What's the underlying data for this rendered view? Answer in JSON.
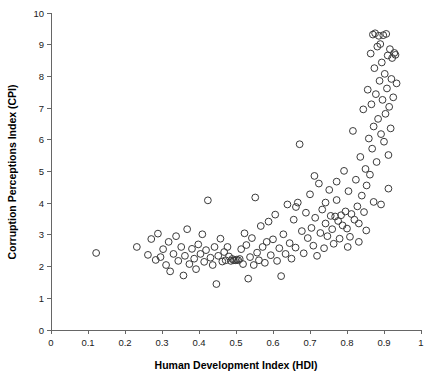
{
  "chart_data": {
    "type": "scatter",
    "title": "",
    "xlabel": "Human Development Index (HDI)",
    "ylabel": "Corruption Perceptions Index (CPI)",
    "xlim": [
      0,
      1
    ],
    "ylim": [
      0,
      10
    ],
    "xticks": [
      0,
      0.1,
      0.2,
      0.3,
      0.4,
      0.5,
      0.6,
      0.7,
      0.8,
      0.9,
      1
    ],
    "xtick_labels": [
      "0",
      "0.1",
      "0.2",
      "0.3",
      "0.4",
      "0.5",
      "0.6",
      "0.7",
      "0.8",
      "0.9",
      "1"
    ],
    "yticks": [
      0,
      1,
      2,
      3,
      4,
      5,
      6,
      7,
      8,
      9,
      10
    ],
    "ytick_labels": [
      "0",
      "1",
      "2",
      "3",
      "4",
      "5",
      "6",
      "7",
      "8",
      "9",
      "10"
    ],
    "grid": false,
    "legend": false,
    "marker": {
      "shape": "circle",
      "filled": false,
      "radius_px": 3.4,
      "stroke": "#3a3a3a",
      "stroke_width": 1
    },
    "axis_color": "#666666",
    "background": "#ffffff",
    "n_points": 160,
    "points": [
      [
        0.122,
        2.43
      ],
      [
        0.232,
        2.62
      ],
      [
        0.262,
        2.37
      ],
      [
        0.271,
        2.87
      ],
      [
        0.283,
        2.21
      ],
      [
        0.289,
        3.04
      ],
      [
        0.296,
        2.3
      ],
      [
        0.303,
        2.55
      ],
      [
        0.311,
        2.05
      ],
      [
        0.318,
        2.78
      ],
      [
        0.322,
        1.85
      ],
      [
        0.331,
        2.4
      ],
      [
        0.338,
        2.96
      ],
      [
        0.344,
        2.18
      ],
      [
        0.352,
        2.62
      ],
      [
        0.358,
        1.72
      ],
      [
        0.362,
        2.34
      ],
      [
        0.368,
        3.18
      ],
      [
        0.374,
        2.08
      ],
      [
        0.381,
        2.56
      ],
      [
        0.387,
        2.25
      ],
      [
        0.392,
        1.92
      ],
      [
        0.398,
        2.7
      ],
      [
        0.404,
        2.4
      ],
      [
        0.409,
        3.02
      ],
      [
        0.414,
        2.15
      ],
      [
        0.419,
        2.52
      ],
      [
        0.424,
        4.09
      ],
      [
        0.431,
        2.28
      ],
      [
        0.437,
        2.05
      ],
      [
        0.442,
        2.62
      ],
      [
        0.447,
        1.45
      ],
      [
        0.452,
        2.34
      ],
      [
        0.458,
        2.88
      ],
      [
        0.463,
        2.16
      ],
      [
        0.468,
        2.46
      ],
      [
        0.472,
        2.2
      ],
      [
        0.477,
        2.62
      ],
      [
        0.481,
        2.32
      ],
      [
        0.486,
        2.18
      ],
      [
        0.49,
        2.24
      ],
      [
        0.494,
        2.2
      ],
      [
        0.498,
        2.2
      ],
      [
        0.502,
        2.22
      ],
      [
        0.506,
        2.2
      ],
      [
        0.51,
        2.24
      ],
      [
        0.514,
        2.55
      ],
      [
        0.519,
        2.08
      ],
      [
        0.523,
        3.05
      ],
      [
        0.528,
        2.68
      ],
      [
        0.533,
        1.62
      ],
      [
        0.538,
        2.3
      ],
      [
        0.543,
        2.9
      ],
      [
        0.548,
        2.05
      ],
      [
        0.552,
        4.18
      ],
      [
        0.557,
        2.44
      ],
      [
        0.562,
        2.2
      ],
      [
        0.567,
        3.28
      ],
      [
        0.572,
        2.62
      ],
      [
        0.578,
        2.12
      ],
      [
        0.583,
        2.78
      ],
      [
        0.588,
        3.42
      ],
      [
        0.594,
        2.36
      ],
      [
        0.6,
        2.86
      ],
      [
        0.606,
        3.64
      ],
      [
        0.611,
        2.18
      ],
      [
        0.617,
        2.58
      ],
      [
        0.622,
        1.7
      ],
      [
        0.628,
        3.02
      ],
      [
        0.634,
        2.4
      ],
      [
        0.639,
        3.96
      ],
      [
        0.645,
        2.74
      ],
      [
        0.65,
        2.25
      ],
      [
        0.656,
        3.48
      ],
      [
        0.661,
        2.6
      ],
      [
        0.667,
        4.02
      ],
      [
        0.672,
        5.86
      ],
      [
        0.678,
        3.12
      ],
      [
        0.683,
        2.42
      ],
      [
        0.689,
        3.7
      ],
      [
        0.694,
        2.9
      ],
      [
        0.7,
        4.28
      ],
      [
        0.704,
        3.22
      ],
      [
        0.709,
        2.66
      ],
      [
        0.714,
        3.54
      ],
      [
        0.719,
        2.34
      ],
      [
        0.724,
        4.62
      ],
      [
        0.728,
        3.06
      ],
      [
        0.733,
        3.8
      ],
      [
        0.738,
        2.58
      ],
      [
        0.742,
        3.36
      ],
      [
        0.747,
        2.96
      ],
      [
        0.752,
        4.42
      ],
      [
        0.756,
        3.6
      ],
      [
        0.76,
        3.18
      ],
      [
        0.764,
        2.72
      ],
      [
        0.768,
        3.58
      ],
      [
        0.772,
        4.1
      ],
      [
        0.776,
        3.44
      ],
      [
        0.78,
        2.88
      ],
      [
        0.784,
        3.62
      ],
      [
        0.788,
        3.3
      ],
      [
        0.792,
        5.02
      ],
      [
        0.796,
        3.74
      ],
      [
        0.8,
        3.2
      ],
      [
        0.804,
        4.38
      ],
      [
        0.808,
        2.94
      ],
      [
        0.812,
        3.66
      ],
      [
        0.816,
        6.28
      ],
      [
        0.82,
        3.48
      ],
      [
        0.824,
        4.74
      ],
      [
        0.828,
        3.9
      ],
      [
        0.832,
        3.36
      ],
      [
        0.836,
        5.46
      ],
      [
        0.84,
        4.24
      ],
      [
        0.844,
        6.96
      ],
      [
        0.846,
        3.72
      ],
      [
        0.85,
        5.08
      ],
      [
        0.853,
        4.56
      ],
      [
        0.856,
        7.58
      ],
      [
        0.859,
        6.04
      ],
      [
        0.862,
        4.9
      ],
      [
        0.864,
        8.72
      ],
      [
        0.866,
        7.12
      ],
      [
        0.868,
        5.72
      ],
      [
        0.87,
        9.32
      ],
      [
        0.872,
        6.42
      ],
      [
        0.874,
        8.26
      ],
      [
        0.876,
        9.36
      ],
      [
        0.878,
        7.44
      ],
      [
        0.88,
        5.3
      ],
      [
        0.882,
        8.94
      ],
      [
        0.884,
        6.66
      ],
      [
        0.886,
        9.28
      ],
      [
        0.888,
        7.86
      ],
      [
        0.89,
        9.02
      ],
      [
        0.892,
        6.18
      ],
      [
        0.894,
        8.44
      ],
      [
        0.896,
        7.26
      ],
      [
        0.898,
        9.3
      ],
      [
        0.9,
        5.94
      ],
      [
        0.902,
        8.08
      ],
      [
        0.904,
        6.82
      ],
      [
        0.906,
        9.34
      ],
      [
        0.908,
        7.62
      ],
      [
        0.91,
        8.66
      ],
      [
        0.912,
        5.52
      ],
      [
        0.914,
        7.04
      ],
      [
        0.916,
        8.86
      ],
      [
        0.918,
        6.36
      ],
      [
        0.92,
        7.92
      ],
      [
        0.922,
        8.58
      ],
      [
        0.925,
        7.34
      ],
      [
        0.928,
        8.74
      ],
      [
        0.931,
        8.68
      ],
      [
        0.934,
        7.78
      ],
      [
        0.662,
        3.88
      ],
      [
        0.712,
        4.86
      ],
      [
        0.742,
        4.02
      ],
      [
        0.772,
        4.68
      ],
      [
        0.802,
        2.62
      ],
      [
        0.832,
        2.78
      ],
      [
        0.852,
        3.14
      ],
      [
        0.872,
        4.04
      ],
      [
        0.892,
        3.96
      ],
      [
        0.912,
        4.46
      ]
    ]
  }
}
